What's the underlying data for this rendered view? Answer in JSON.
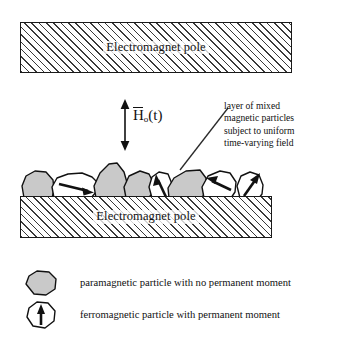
{
  "figure": {
    "type": "schematic-diagram"
  },
  "poles": {
    "top": {
      "label": "Electromagnet pole"
    },
    "bottom": {
      "label": "Electromagnet pole"
    }
  },
  "field": {
    "symbol_h": "H",
    "subscript": "o",
    "argument": "(t)",
    "arrow_name": "double-headed-vertical-arrow"
  },
  "annotation": {
    "lines": [
      "layer of mixed",
      "magnetic particles",
      "subject to uniform",
      "time-varying field"
    ],
    "line_0": "layer of mixed",
    "line_1": "magnetic particles",
    "line_2": "subject to uniform",
    "line_3": "time-varying field"
  },
  "legend": {
    "items": [
      {
        "icon": "paramagnetic-particle-icon",
        "label": "paramagnetic particle with no permanent moment",
        "fill": "#c9c9c9",
        "has_arrow": false
      },
      {
        "icon": "ferromagnetic-particle-icon",
        "label": "ferromagnetic particle with permanent moment",
        "fill": "#ffffff",
        "has_arrow": true
      }
    ]
  },
  "particles": [
    {
      "index": 0,
      "type": "paramagnetic",
      "fill": "#c9c9c9",
      "arrow_deg": null
    },
    {
      "index": 1,
      "type": "ferromagnetic",
      "fill": "#ffffff",
      "arrow_deg": 20
    },
    {
      "index": 2,
      "type": "paramagnetic",
      "fill": "#c9c9c9",
      "arrow_deg": null
    },
    {
      "index": 3,
      "type": "paramagnetic",
      "fill": "#c9c9c9",
      "arrow_deg": null
    },
    {
      "index": 4,
      "type": "ferromagnetic",
      "fill": "#ffffff",
      "arrow_deg": -75
    },
    {
      "index": 5,
      "type": "paramagnetic",
      "fill": "#c9c9c9",
      "arrow_deg": null
    },
    {
      "index": 6,
      "type": "ferromagnetic",
      "fill": "#ffffff",
      "arrow_deg": 205
    },
    {
      "index": 7,
      "type": "ferromagnetic",
      "fill": "#ffffff",
      "arrow_deg": -60
    }
  ],
  "colors": {
    "ink": "#111111",
    "particle_gray": "#c9c9c9",
    "particle_white": "#ffffff",
    "hatch": "#3a3a3a",
    "background": "#ffffff"
  }
}
